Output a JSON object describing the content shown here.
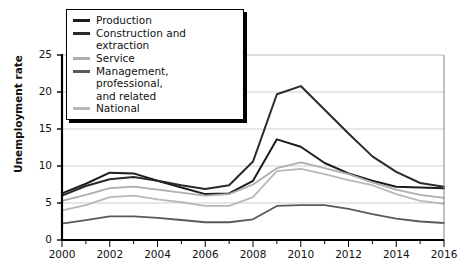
{
  "chart_data": {
    "type": "line",
    "title": "",
    "xlabel": "",
    "ylabel": "Unemployment rate",
    "xlim": [
      2000,
      2016
    ],
    "ylim": [
      0,
      25
    ],
    "grid": true,
    "legend_position": "top-left",
    "x": [
      2000,
      2001,
      2002,
      2003,
      2004,
      2005,
      2006,
      2007,
      2008,
      2009,
      2010,
      2011,
      2012,
      2013,
      2014,
      2015,
      2016
    ],
    "xticks": [
      "2000",
      "2002",
      "2004",
      "2006",
      "2008",
      "2010",
      "2012",
      "2014",
      "2016"
    ],
    "yticks": [
      "0",
      "5",
      "10",
      "15",
      "20",
      "25"
    ],
    "series": [
      {
        "name": "Production",
        "color": "#1c1c1c",
        "width": 2.0,
        "values": [
          6.3,
          7.6,
          9.1,
          9.0,
          8.0,
          7.1,
          6.2,
          6.3,
          8.0,
          13.6,
          12.6,
          10.4,
          9.0,
          8.0,
          7.2,
          7.1,
          7.0
        ]
      },
      {
        "name": "Construction and extraction",
        "color": "#2a2a2a",
        "width": 2.0,
        "values": [
          6.0,
          7.3,
          8.2,
          8.5,
          8.0,
          7.4,
          6.9,
          7.4,
          10.6,
          19.7,
          20.8,
          17.6,
          14.4,
          11.3,
          9.2,
          7.7,
          7.2
        ]
      },
      {
        "name": "Service",
        "color": "#adadad",
        "width": 1.8,
        "values": [
          5.3,
          6.1,
          7.0,
          7.2,
          6.8,
          6.4,
          6.0,
          6.2,
          7.5,
          9.7,
          10.5,
          9.7,
          8.9,
          7.8,
          6.8,
          6.1,
          5.7
        ]
      },
      {
        "name": "Management, professional, and related",
        "color": "#5a5a5a",
        "width": 1.8,
        "values": [
          2.2,
          2.7,
          3.2,
          3.2,
          3.0,
          2.7,
          2.4,
          2.4,
          2.8,
          4.6,
          4.7,
          4.7,
          4.2,
          3.5,
          2.9,
          2.5,
          2.3
        ]
      },
      {
        "name": "National",
        "color": "#b8b8b8",
        "width": 1.8,
        "values": [
          4.0,
          4.7,
          5.8,
          6.0,
          5.5,
          5.1,
          4.6,
          4.6,
          5.8,
          9.3,
          9.6,
          8.9,
          8.1,
          7.4,
          6.2,
          5.3,
          4.9
        ]
      }
    ]
  },
  "legend": {
    "items": [
      {
        "label": "Production",
        "color": "#1c1c1c",
        "second_line": ""
      },
      {
        "label": "Construction and extraction",
        "color": "#2a2a2a",
        "second_line": ""
      },
      {
        "label": "Service",
        "color": "#adadad",
        "second_line": ""
      },
      {
        "label": "Management, professional,",
        "color": "#5a5a5a",
        "second_line": "and related"
      },
      {
        "label": "National",
        "color": "#b8b8b8",
        "second_line": ""
      }
    ]
  },
  "axes": {
    "y_title": "Unemployment rate",
    "y_tick_labels": [
      "25",
      "20",
      "15",
      "10",
      "5",
      "0"
    ],
    "x_tick_labels": [
      "2000",
      "2002",
      "2004",
      "2006",
      "2008",
      "2010",
      "2012",
      "2014",
      "2016"
    ]
  },
  "colors": {
    "axis": "#000000",
    "grid": "#c9c9c9",
    "background": "#ffffff",
    "text": "#111111"
  }
}
